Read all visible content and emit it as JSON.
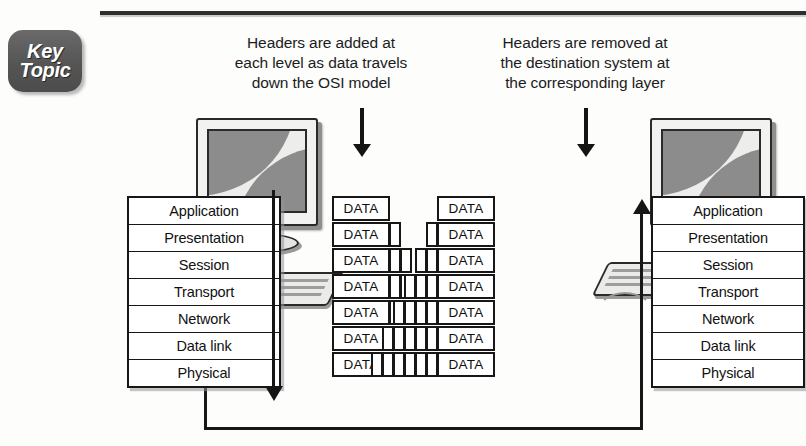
{
  "figure": {
    "badge": {
      "line1": "Key",
      "line2": "Topic"
    },
    "captions": {
      "left": "Headers are added at each level as data travels down the OSI model",
      "left_lines": [
        "Headers are added at",
        "each level as data travels",
        "down the OSI model"
      ],
      "right": "Headers are removed at the destination system at the corresponding layer",
      "right_lines": [
        "Headers are removed at",
        "the destination system at",
        "the corresponding layer"
      ]
    },
    "osi_layers": [
      "Application",
      "Presentation",
      "Session",
      "Transport",
      "Network",
      "Data link",
      "Physical"
    ],
    "data_label": "DATA",
    "encapsulation": {
      "source_header_counts": [
        0,
        1,
        2,
        3,
        4,
        5,
        6
      ],
      "destination_header_counts": [
        0,
        1,
        2,
        3,
        4,
        5,
        6
      ]
    },
    "colors": {
      "line": "#171717",
      "badge_fill": "#5d5d5d",
      "badge_text": "#ffffff",
      "box_fill": "#ffffff",
      "screen_wave": "#8c8c8c",
      "page_background": "#fdfdfc"
    }
  }
}
